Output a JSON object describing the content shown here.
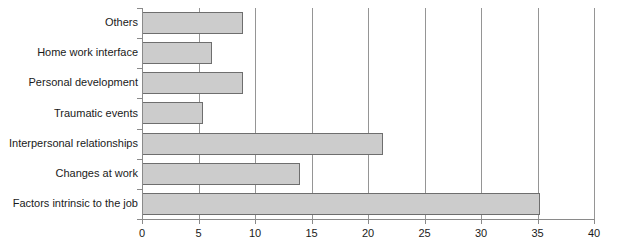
{
  "chart_data": {
    "type": "bar",
    "orientation": "horizontal",
    "title": "",
    "xlabel": "",
    "ylabel": "",
    "xlim": [
      0,
      40
    ],
    "xticks": [
      0,
      5,
      10,
      15,
      20,
      25,
      30,
      35,
      40
    ],
    "xtick_labels": [
      "0",
      "5",
      "10",
      "15",
      "20",
      "25",
      "30",
      "35",
      "40"
    ],
    "grid": true,
    "legend": false,
    "categories": [
      "Others",
      "Home work interface",
      "Personal development",
      "Traumatic events",
      "Interpersonal relationships",
      "Changes at work",
      "Factors intrinsic to the job"
    ],
    "values": [
      8.9,
      6.2,
      8.9,
      5.4,
      21.3,
      14.0,
      35.2
    ],
    "bar_fill_color": "#cccccc",
    "bar_border_color": "#6e6e6e",
    "axis_color": "#8a8a8a",
    "text_color": "#1a1a1a",
    "background_color": "#ffffff"
  }
}
